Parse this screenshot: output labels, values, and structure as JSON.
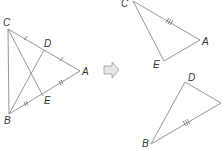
{
  "figure": {
    "left_triangle": {
      "labels": {
        "C": "C",
        "D": "D",
        "A": "A",
        "E": "E",
        "B": "B"
      }
    },
    "arrow": {
      "direction": "right",
      "fill": "#e6e6e6",
      "stroke": "#9a9a9a"
    },
    "top_right_triangle": {
      "labels": {
        "C": "C",
        "A": "A",
        "E": "E"
      }
    },
    "bottom_right_triangle": {
      "labels": {
        "D": "D",
        "B": "B"
      }
    },
    "colors": {
      "line": "#8a8a8a",
      "label": "#333333"
    }
  }
}
